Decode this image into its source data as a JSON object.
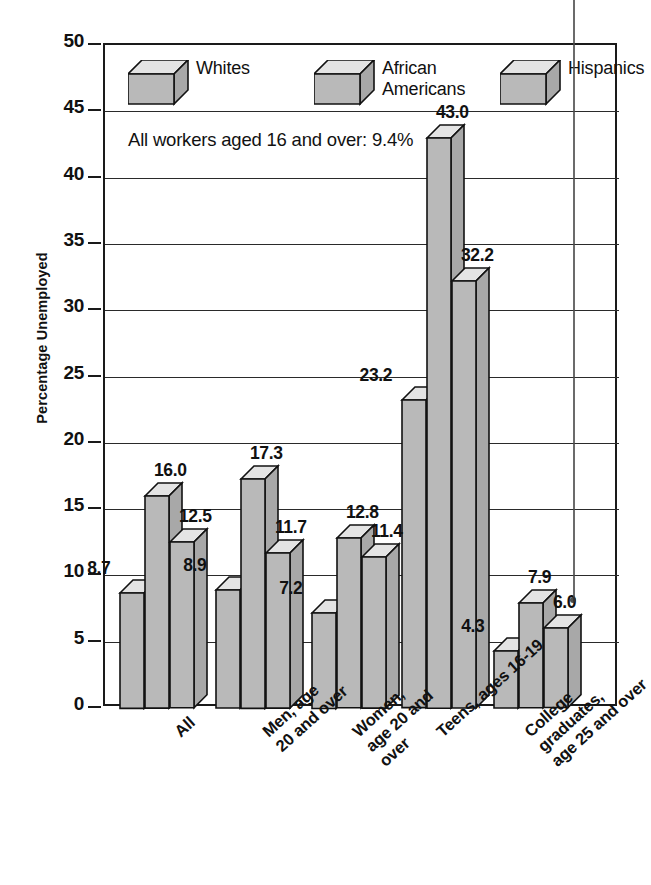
{
  "chart_data": {
    "type": "bar",
    "title": "",
    "xlabel": "",
    "ylabel": "Percentage Unemployed",
    "ylim": [
      0,
      50
    ],
    "ytick_values": [
      0,
      5,
      10,
      15,
      20,
      25,
      30,
      35,
      40,
      45,
      50
    ],
    "ytick_labels": [
      "0",
      "5",
      "10",
      "15",
      "20",
      "25",
      "30",
      "35",
      "40",
      "45",
      "50"
    ],
    "grid": true,
    "legend_position": "inside-top-left",
    "annotation": "All workers aged 16 and over: 9.4%",
    "categories": [
      "All",
      "Men, age\n20 and over",
      "Women,\nage 20 and\nover",
      "Teens, ages 16-19",
      "College graduates,\nage 25 and over"
    ],
    "series": [
      {
        "name": "Whites",
        "color": "#b9b9b9",
        "values": [
          8.7,
          8.9,
          7.2,
          23.2,
          4.3
        ],
        "labels": [
          "8.7",
          "8.9",
          "7.2",
          "23.2",
          "4.3"
        ]
      },
      {
        "name": "African\nAmericans",
        "color": "#b9b9b9",
        "values": [
          16.0,
          17.3,
          12.8,
          43.0,
          7.9
        ],
        "labels": [
          "16.0",
          "17.3",
          "12.8",
          "43.0",
          "7.9"
        ]
      },
      {
        "name": "Hispanics",
        "color": "#b9b9b9",
        "values": [
          12.5,
          11.7,
          11.4,
          32.2,
          6.0
        ],
        "labels": [
          "12.5",
          "11.7",
          "11.4",
          "32.2",
          "6.0"
        ]
      }
    ]
  },
  "legend": [
    {
      "label": "Whites"
    },
    {
      "label": "African\nAmericans"
    },
    {
      "label": "Hispanics"
    }
  ],
  "colors": {
    "bar_face": "#b9b9b9",
    "bar_top": "#e4e4e4",
    "bar_side": "#a8a8a8",
    "outline": "#121212",
    "grid": "#2a2a2a"
  }
}
